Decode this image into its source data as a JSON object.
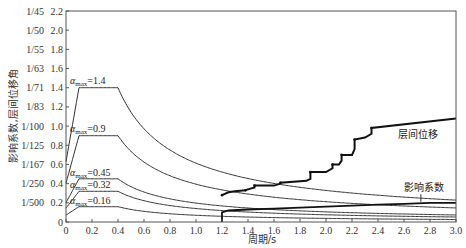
{
  "chart_data": {
    "type": "line",
    "title": "",
    "xlabel": "周期/s",
    "ylabel": "影响系数,层间位移角",
    "xlim": [
      0,
      3.0
    ],
    "ylim": [
      0,
      2.2
    ],
    "grid": false,
    "x_ticks": [
      "0",
      "0.2",
      "0.4",
      "0.6",
      "0.8",
      "1.0",
      "1.2",
      "1.4",
      "1.6",
      "1.8",
      "2.0",
      "2.2",
      "2.4",
      "2.6",
      "2.8",
      "3.0"
    ],
    "x_tick_values": [
      0,
      0.2,
      0.4,
      0.6,
      0.8,
      1.0,
      1.2,
      1.4,
      1.6,
      1.8,
      2.0,
      2.2,
      2.4,
      2.6,
      2.8,
      3.0
    ],
    "y_ticks": [
      "0",
      "0.2",
      "0.4",
      "0.6",
      "0.8",
      "1.0",
      "1.2",
      "1.4",
      "1.6",
      "1.8",
      "2.0",
      "2.2"
    ],
    "y_tick_values": [
      0,
      0.2,
      0.4,
      0.6,
      0.8,
      1.0,
      1.2,
      1.4,
      1.6,
      1.8,
      2.0,
      2.2
    ],
    "y_ticks_secondary": [
      "",
      "1/500",
      "1/250",
      "1/167",
      "1/125",
      "1/100",
      "1/83",
      "1/71",
      "1/63",
      "1/55",
      "1/50",
      "1/45"
    ],
    "spectrum_params": {
      "T1": 0.1,
      "Tg": 0.4,
      "gamma": 0.9,
      "start_ratio": 0.45
    },
    "series": [
      {
        "name": "αmax=1.4",
        "amax": 1.4,
        "label_main": "α",
        "label_sub": "max",
        "label_value": "=1.4"
      },
      {
        "name": "αmax=0.9",
        "amax": 0.9,
        "label_main": "α",
        "label_sub": "max",
        "label_value": "=0.9"
      },
      {
        "name": "αmax=0.45",
        "amax": 0.45,
        "label_main": "α",
        "label_sub": "max",
        "label_value": "=0.45"
      },
      {
        "name": "αmax=0.32",
        "amax": 0.32,
        "label_main": "α",
        "label_sub": "max",
        "label_value": "=0.32"
      },
      {
        "name": "αmax=0.16",
        "amax": 0.16,
        "label_main": "α",
        "label_sub": "max",
        "label_value": "=0.16"
      },
      {
        "name": "层间位移",
        "x": [
          1.2,
          1.25,
          1.3,
          1.38,
          1.4,
          1.45,
          1.45,
          1.6,
          1.65,
          1.65,
          1.85,
          1.88,
          1.88,
          2.0,
          2.05,
          2.05,
          2.1,
          2.12,
          2.12,
          2.2,
          2.22,
          2.22,
          2.3,
          2.35,
          2.35,
          3.0
        ],
        "y": [
          0.28,
          0.31,
          0.32,
          0.33,
          0.34,
          0.36,
          0.38,
          0.38,
          0.4,
          0.41,
          0.43,
          0.45,
          0.52,
          0.52,
          0.56,
          0.6,
          0.6,
          0.64,
          0.7,
          0.7,
          0.76,
          0.86,
          0.88,
          0.92,
          0.98,
          1.08
        ]
      },
      {
        "name": "影响系数",
        "x": [
          1.2,
          1.2,
          1.25,
          1.4,
          1.6,
          1.8,
          2.0,
          2.2,
          2.4,
          2.6,
          2.8,
          3.0
        ],
        "y": [
          0.0,
          0.1,
          0.12,
          0.13,
          0.14,
          0.15,
          0.16,
          0.17,
          0.18,
          0.19,
          0.2,
          0.2
        ]
      }
    ],
    "annotations": [
      {
        "text": "层间位移",
        "x": 2.55,
        "y": 0.88
      },
      {
        "text": "影响系数",
        "x": 2.6,
        "y": 0.32
      }
    ]
  }
}
